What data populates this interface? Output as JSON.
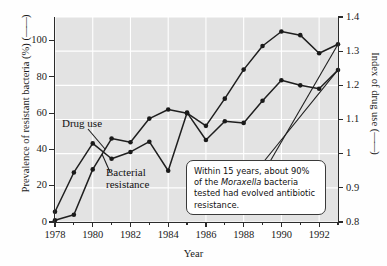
{
  "chart_data": {
    "type": "line",
    "title": "",
    "xlabel": "Year",
    "ylabel": "Prevalence of resistant bacteria (%)",
    "ylabel_right": "Index of drug use",
    "grid": true,
    "legend_position": "inline-annotations",
    "x": [
      1978,
      1979,
      1980,
      1981,
      1982,
      1983,
      1984,
      1985,
      1986,
      1987,
      1988,
      1989,
      1990,
      1991,
      1992,
      1993
    ],
    "xlim": [
      1978,
      1993
    ],
    "xticks_major": [
      1978,
      1980,
      1982,
      1984,
      1986,
      1988,
      1990,
      1992
    ],
    "xticks_minor": [
      1979,
      1981,
      1983,
      1985,
      1987,
      1989,
      1991,
      1993
    ],
    "ylim": [
      0,
      113
    ],
    "yticks": [
      0,
      20,
      40,
      60,
      80,
      100
    ],
    "ylim_right": [
      0.8,
      1.4
    ],
    "yticks_right": [
      "0.8",
      "0.9",
      "1",
      "1.1",
      "1.2",
      "1.3",
      "1.4"
    ],
    "series": [
      {
        "name": "Drug use",
        "axis": "right",
        "unit": "index",
        "values": [
          0.83,
          0.945,
          1.03,
          0.985,
          1.005,
          1.035,
          0.95,
          1.12,
          1.04,
          1.095,
          1.09,
          1.155,
          1.215,
          1.2,
          1.19,
          1.245
        ]
      },
      {
        "name": "Bacterial resistance",
        "axis": "left",
        "unit": "percent",
        "values": [
          1,
          4,
          29,
          46,
          44,
          57,
          62,
          60,
          53,
          68,
          84,
          97,
          105,
          103,
          93,
          98
        ]
      }
    ],
    "annotations": [
      {
        "name": "callout",
        "line1": "Within 15 years, about 90%",
        "line2_pre": "of the ",
        "line2_italic": "Moraxella",
        "line2_post": " bacteria",
        "line3": "tested had evolved",
        "line4": "antibiotic resistance."
      }
    ],
    "colors": {
      "plot_background": "#e3e3e3",
      "gridline": "#ffffff",
      "line": "#1f1f1f",
      "marker": "#1a1a1a",
      "axis": "#2b2b2b",
      "callout_background": "#ffffff",
      "callout_border": "#3a3a3a"
    }
  },
  "axes": {
    "left_title_text": "Prevalence of resistant bacteria (%) (",
    "left_title_suffix": ")",
    "right_title_text": "Index of drug use (",
    "right_title_suffix": ")",
    "line_glyph": "——",
    "x_title": "Year"
  },
  "series_labels": {
    "drug_use": "Drug use",
    "bacterial_line1": "Bacterial",
    "bacterial_line2": "resistance"
  }
}
